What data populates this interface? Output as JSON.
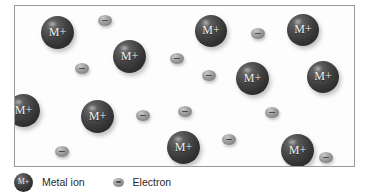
{
  "diagram": {
    "frame": {
      "x": 14,
      "y": 5,
      "width": 341,
      "height": 162
    },
    "ion_label": "M+",
    "electron_sign": "−",
    "colors": {
      "ion_dark": "#2a2a2a",
      "ion_light": "#7d7d7d",
      "electron_light": "#c8c8c8",
      "electron_dark": "#777777",
      "frame_border": "#9a9a9a",
      "background": "#fdfdfd",
      "text": "#2a2a2a"
    },
    "metal_ions": [
      {
        "x": 26,
        "y": 10,
        "size": 33,
        "font": 12
      },
      {
        "x": 98,
        "y": 34,
        "size": 33,
        "font": 12
      },
      {
        "x": 180,
        "y": 9,
        "size": 32,
        "font": 12
      },
      {
        "x": 272,
        "y": 8,
        "size": 32,
        "font": 12
      },
      {
        "x": 221,
        "y": 56,
        "size": 33,
        "font": 12
      },
      {
        "x": 292,
        "y": 55,
        "size": 32,
        "font": 12
      },
      {
        "x": -8,
        "y": 88,
        "size": 33,
        "font": 12
      },
      {
        "x": 66,
        "y": 94,
        "size": 33,
        "font": 12
      },
      {
        "x": 152,
        "y": 125,
        "size": 33,
        "font": 12
      },
      {
        "x": 266,
        "y": 128,
        "size": 33,
        "font": 12
      }
    ],
    "electrons": [
      {
        "x": 83,
        "y": 9,
        "w": 14,
        "h": 11
      },
      {
        "x": 155,
        "y": 47,
        "w": 14,
        "h": 11
      },
      {
        "x": 236,
        "y": 22,
        "w": 14,
        "h": 11
      },
      {
        "x": 60,
        "y": 57,
        "w": 14,
        "h": 11
      },
      {
        "x": 187,
        "y": 64,
        "w": 14,
        "h": 11
      },
      {
        "x": 344,
        "y": 89,
        "w": 14,
        "h": 11
      },
      {
        "x": 121,
        "y": 104,
        "w": 14,
        "h": 11
      },
      {
        "x": 163,
        "y": 100,
        "w": 14,
        "h": 11
      },
      {
        "x": 250,
        "y": 101,
        "w": 14,
        "h": 11
      },
      {
        "x": 40,
        "y": 140,
        "w": 14,
        "h": 11
      },
      {
        "x": 207,
        "y": 128,
        "w": 14,
        "h": 11
      },
      {
        "x": 304,
        "y": 146,
        "w": 14,
        "h": 11
      }
    ]
  },
  "legend": {
    "items": [
      {
        "icon": "metal-ion-sphere-icon",
        "swatch_label": "M+",
        "label": "Metal ion"
      },
      {
        "icon": "electron-ellipse-icon",
        "swatch_label": "−",
        "label": "Electron"
      }
    ]
  }
}
